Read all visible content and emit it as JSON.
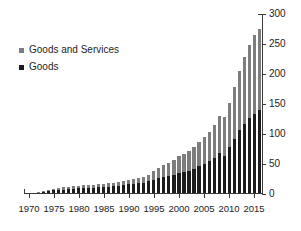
{
  "chart_data": {
    "type": "bar",
    "subtype": "stacked-bar",
    "title": "",
    "subtitle": "",
    "xlabel": "",
    "ylabel": "",
    "ylim": [
      0,
      300
    ],
    "y_ticks": [
      0,
      50,
      100,
      150,
      200,
      250,
      300
    ],
    "y_tick_labels": [
      "0",
      "50",
      "100",
      "150",
      "200",
      "250",
      "300"
    ],
    "y_axis_position": "right",
    "grid": false,
    "legend_position": "upper-left",
    "legend": [
      "Goods and Services",
      "Goods"
    ],
    "colors": {
      "goods_and_services": "#7d7d7d",
      "goods": "#1c1c1c",
      "axis": "#3a3a3a",
      "text": "#1d1d1d",
      "background": "#ffffff"
    },
    "x_tick_labels": [
      "1970",
      "1975",
      "1980",
      "1985",
      "1990",
      "1995",
      "2000",
      "2005",
      "2010",
      "2015"
    ],
    "x_tick_years": [
      1970,
      1975,
      1980,
      1985,
      1990,
      1995,
      2000,
      2005,
      2010,
      2015
    ],
    "categories": [
      "1970",
      "1971",
      "1972",
      "1973",
      "1974",
      "1975",
      "1976",
      "1977",
      "1978",
      "1979",
      "1980",
      "1981",
      "1982",
      "1983",
      "1984",
      "1985",
      "1986",
      "1987",
      "1988",
      "1989",
      "1990",
      "1991",
      "1992",
      "1993",
      "1994",
      "1995",
      "1996",
      "1997",
      "1998",
      "1999",
      "2000",
      "2001",
      "2002",
      "2003",
      "2004",
      "2005",
      "2006",
      "2007",
      "2008",
      "2009",
      "2010",
      "2011",
      "2012",
      "2013",
      "2014",
      "2015",
      "2016"
    ],
    "series": [
      {
        "name": "Goods and Services",
        "stack_role": "total",
        "values": [
          2,
          2.5,
          3,
          4.5,
          6,
          9,
          10,
          11,
          12,
          13,
          14,
          15,
          15,
          15,
          16,
          17,
          18,
          19,
          20,
          22,
          24,
          25,
          26,
          28,
          32,
          38,
          43,
          48,
          52,
          57,
          63,
          66,
          72,
          78,
          86,
          95,
          104,
          115,
          130,
          128,
          152,
          178,
          205,
          228,
          248,
          265,
          275
        ]
      },
      {
        "name": "Goods",
        "stack_role": "base",
        "values": [
          1.5,
          2,
          2.5,
          3.5,
          4.5,
          6,
          7,
          7.5,
          8,
          9,
          10,
          10.5,
          10.5,
          10.5,
          11,
          11.5,
          12,
          13,
          14,
          15,
          16,
          17,
          18,
          19,
          21,
          24,
          26,
          28,
          30,
          32,
          35,
          36,
          39,
          42,
          46,
          50,
          55,
          60,
          68,
          64,
          78,
          92,
          106,
          116,
          126,
          134,
          140
        ]
      }
    ]
  },
  "legend": {
    "items": [
      {
        "label": "Goods and Services",
        "color": "#7d7d7d"
      },
      {
        "label": "Goods",
        "color": "#1c1c1c"
      }
    ]
  }
}
